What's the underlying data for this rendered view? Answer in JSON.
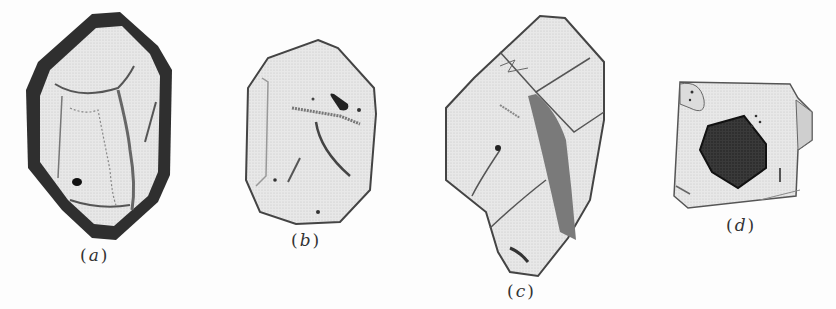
{
  "figure": {
    "panels": [
      {
        "id": "a",
        "label": "(a)",
        "letter": "a",
        "description": "prismatic crystal with dark rim and inclusions"
      },
      {
        "id": "b",
        "label": "(b)",
        "letter": "b",
        "description": "rounded crystal with dark inclusion and needles"
      },
      {
        "id": "c",
        "label": "(c)",
        "letter": "c",
        "description": "elongated crystal with fractures"
      },
      {
        "id": "d",
        "label": "(d)",
        "letter": "d",
        "description": "square crystal with large dark core inclusion"
      }
    ]
  },
  "colors": {
    "background": "#fdfdfd",
    "crystal_fill": "#e9e9e9",
    "outline": "#3a3a3a",
    "dark_rim": "#2b2b2b",
    "inclusion": "#222222"
  }
}
